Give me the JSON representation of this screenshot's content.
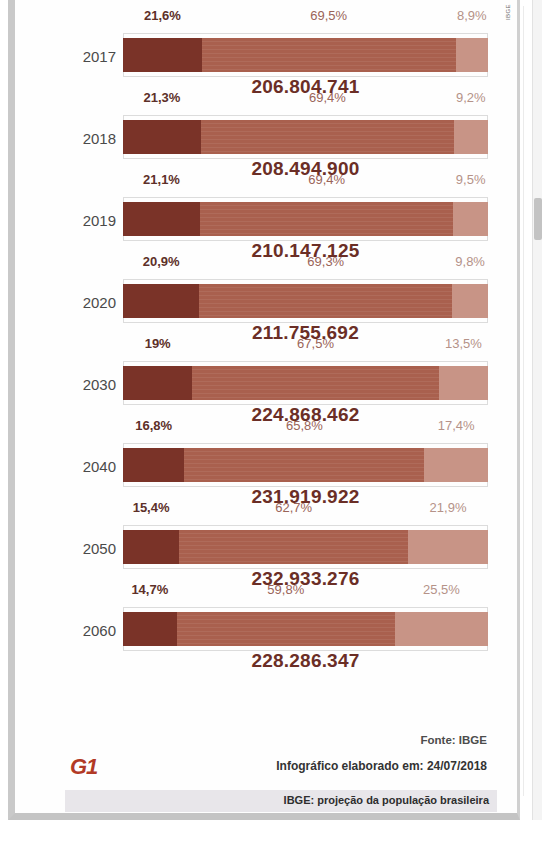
{
  "credit": "IBGE",
  "chart_data": {
    "type": "bar",
    "subtype": "stacked-horizontal-100pct",
    "title": "IBGE: projeção da população brasileira",
    "xlabel": "",
    "ylabel": "",
    "xlim": [
      0,
      100
    ],
    "grid": false,
    "legend_position": "none",
    "categories": [
      "2017",
      "2018",
      "2019",
      "2020",
      "2030",
      "2040",
      "2050",
      "2060"
    ],
    "series": [
      {
        "name": "0 a 14 anos",
        "key": "young",
        "color": "#7a3328",
        "values": [
          21.6,
          21.3,
          21.1,
          20.9,
          19.0,
          16.8,
          15.4,
          14.7
        ]
      },
      {
        "name": "15 a 64 anos",
        "key": "adult",
        "color": "#a9604e",
        "values": [
          69.5,
          69.4,
          69.4,
          69.3,
          67.5,
          65.8,
          62.7,
          59.8
        ]
      },
      {
        "name": "65 anos ou mais",
        "key": "senior",
        "color": "#c89486",
        "values": [
          8.9,
          9.2,
          9.5,
          9.8,
          13.5,
          17.4,
          21.9,
          25.5
        ]
      }
    ],
    "totals": [
      206804741,
      208494900,
      210147125,
      211755692,
      224868462,
      231919922,
      232933276,
      228286347
    ],
    "rows": [
      {
        "year": "2017",
        "young_pct": "21,6%",
        "adult_pct": "69,5%",
        "senior_pct": "8,9%",
        "total": "206.804.741",
        "young": 21.6,
        "adult": 69.5,
        "senior": 8.9
      },
      {
        "year": "2018",
        "young_pct": "21,3%",
        "adult_pct": "69,4%",
        "senior_pct": "9,2%",
        "total": "208.494.900",
        "young": 21.3,
        "adult": 69.4,
        "senior": 9.2
      },
      {
        "year": "2019",
        "young_pct": "21,1%",
        "adult_pct": "69,4%",
        "senior_pct": "9,5%",
        "total": "210.147.125",
        "young": 21.1,
        "adult": 69.4,
        "senior": 9.5
      },
      {
        "year": "2020",
        "young_pct": "20,9%",
        "adult_pct": "69,3%",
        "senior_pct": "9,8%",
        "total": "211.755.692",
        "young": 20.9,
        "adult": 69.3,
        "senior": 9.8
      },
      {
        "year": "2030",
        "young_pct": "19%",
        "adult_pct": "67,5%",
        "senior_pct": "13,5%",
        "total": "224.868.462",
        "young": 19.0,
        "adult": 67.5,
        "senior": 13.5
      },
      {
        "year": "2040",
        "young_pct": "16,8%",
        "adult_pct": "65,8%",
        "senior_pct": "17,4%",
        "total": "231.919.922",
        "young": 16.8,
        "adult": 65.8,
        "senior": 17.4
      },
      {
        "year": "2050",
        "young_pct": "15,4%",
        "adult_pct": "62,7%",
        "senior_pct": "21,9%",
        "total": "232.933.276",
        "young": 15.4,
        "adult": 62.7,
        "senior": 21.9
      },
      {
        "year": "2060",
        "young_pct": "14,7%",
        "adult_pct": "59,8%",
        "senior_pct": "25,5%",
        "total": "228.286.347",
        "young": 14.7,
        "adult": 59.8,
        "senior": 25.5
      }
    ]
  },
  "footer": {
    "fonte": "Fonte: IBGE",
    "elaborado": "Infográfico elaborado em: 24/07/2018",
    "logo": "G1",
    "caption": "IBGE: projeção da população brasileira"
  },
  "colors": {
    "young": "#7a3328",
    "adult": "#a9604e",
    "senior": "#c89486",
    "total_text": "#6b2e26",
    "logo": "#b23a26"
  }
}
